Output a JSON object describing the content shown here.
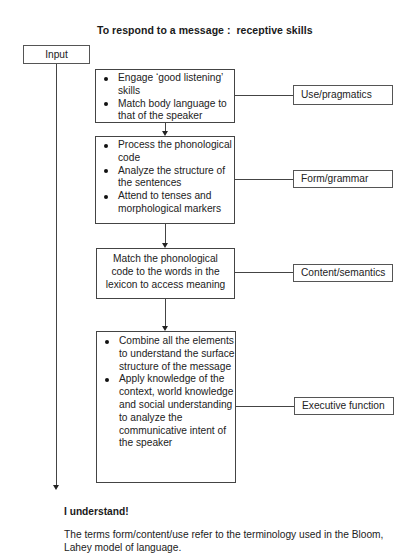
{
  "title": "To respond to a message :  receptive skills",
  "input_label": "Input",
  "process_boxes": [
    {
      "type": "bullets",
      "items": [
        "Engage ‘good listening’ skills",
        "Match body language to that of the speaker"
      ]
    },
    {
      "type": "bullets",
      "items": [
        "Process the phonological code",
        "Analyze the structure of the sentences",
        "Attend to tenses and morphological markers"
      ]
    },
    {
      "type": "text",
      "text": "Match the phonological code to the words in the lexicon to access meaning"
    },
    {
      "type": "bullets",
      "items": [
        "Combine all the elements to understand the surface structure of the message",
        "Apply knowledge of the context, world knowledge and social understanding to analyze the communicative intent of the speaker"
      ]
    }
  ],
  "category_labels": [
    "Use/pragmatics",
    "Form/grammar",
    "Content/semantics",
    "Executive function"
  ],
  "outcome": "I understand!",
  "footnote": "The terms form/content/use refer to the terminology used in the Bloom, Lahey model of language."
}
